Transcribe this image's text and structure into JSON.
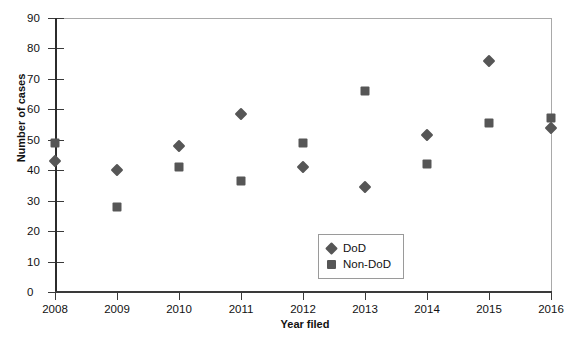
{
  "chart_data": {
    "type": "scatter",
    "title": "",
    "xlabel": "Year filed",
    "ylabel": "Number of cases",
    "categories": [
      "2008",
      "2009",
      "2010",
      "2011",
      "2012",
      "2013",
      "2014",
      "2015",
      "2016"
    ],
    "x": [
      2008,
      2009,
      2010,
      2011,
      2012,
      2013,
      2014,
      2015,
      2016
    ],
    "xlim": [
      2008,
      2016
    ],
    "ylim": [
      0,
      90
    ],
    "yticks": [
      0,
      10,
      20,
      30,
      40,
      50,
      60,
      70,
      80,
      90
    ],
    "ytick_labels": [
      "0",
      "10",
      "20",
      "30",
      "40",
      "50",
      "60",
      "70",
      "80",
      "90"
    ],
    "grid": false,
    "legend_position": "center",
    "marker_color": "#565656",
    "series": [
      {
        "name": "DoD",
        "marker": "diamond",
        "color": "#565656",
        "values": [
          43,
          40,
          48,
          58.5,
          41,
          34.5,
          51.5,
          76,
          54
        ]
      },
      {
        "name": "Non-DoD",
        "marker": "square",
        "color": "#565656",
        "values": [
          49,
          28,
          41,
          36.5,
          49,
          66,
          42,
          55.5,
          57
        ]
      }
    ]
  }
}
